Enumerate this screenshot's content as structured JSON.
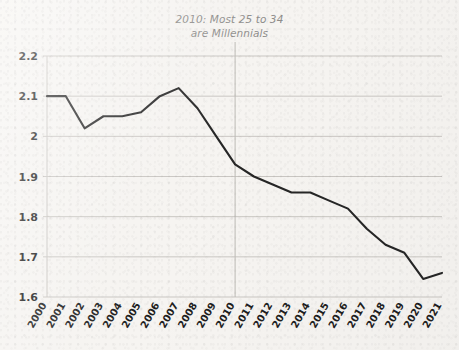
{
  "chart_data": {
    "type": "line",
    "title": "2010: Most 25 to 34 are Millennials",
    "title_line1": "2010: Most 25 to 34",
    "title_line2": "are Millennials",
    "xlabel": "",
    "ylabel": "",
    "categories": [
      "2000",
      "2001",
      "2002",
      "2003",
      "2004",
      "2005",
      "2006",
      "2007",
      "2008",
      "2009",
      "2010",
      "2011",
      "2012",
      "2013",
      "2014",
      "2015",
      "2016",
      "2017",
      "2018",
      "2019",
      "2020",
      "2021"
    ],
    "values": [
      2.1,
      2.1,
      2.02,
      2.05,
      2.05,
      2.06,
      2.1,
      2.12,
      2.07,
      2.0,
      1.93,
      1.9,
      1.88,
      1.86,
      1.86,
      1.84,
      1.82,
      1.77,
      1.73,
      1.71,
      1.645,
      1.66
    ],
    "x": [
      2000,
      2001,
      2002,
      2003,
      2004,
      2005,
      2006,
      2007,
      2008,
      2009,
      2010,
      2011,
      2012,
      2013,
      2014,
      2015,
      2016,
      2017,
      2018,
      2019,
      2020,
      2021
    ],
    "ylim": [
      1.6,
      2.2
    ],
    "xlim": [
      2000,
      2021
    ],
    "ytick_labels": [
      "2.2",
      "2.1",
      "2",
      "1.9",
      "1.8",
      "1.7",
      "1.6"
    ],
    "ytick_values": [
      2.2,
      2.1,
      2.0,
      1.9,
      1.8,
      1.7,
      1.6
    ],
    "grid": true,
    "grid_axis": "y",
    "legend": false,
    "legend_position": "none",
    "annotations": [
      {
        "type": "vline",
        "x": 2010,
        "label": "2010: Most 25 to 34 are Millennials"
      }
    ],
    "series": [
      {
        "name": "value",
        "values": [
          2.1,
          2.1,
          2.02,
          2.05,
          2.05,
          2.06,
          2.1,
          2.12,
          2.07,
          2.0,
          1.93,
          1.9,
          1.88,
          1.86,
          1.86,
          1.84,
          1.82,
          1.77,
          1.73,
          1.71,
          1.645,
          1.66
        ]
      }
    ]
  },
  "style": {
    "background_color": "#f6f4f1",
    "line_color": "#262626",
    "grid_color": "#c9c6c2",
    "axis_text_color": "#1e1e1e",
    "title_color": "#8e8d8b",
    "annotation_line_color": "#bdbab6"
  }
}
